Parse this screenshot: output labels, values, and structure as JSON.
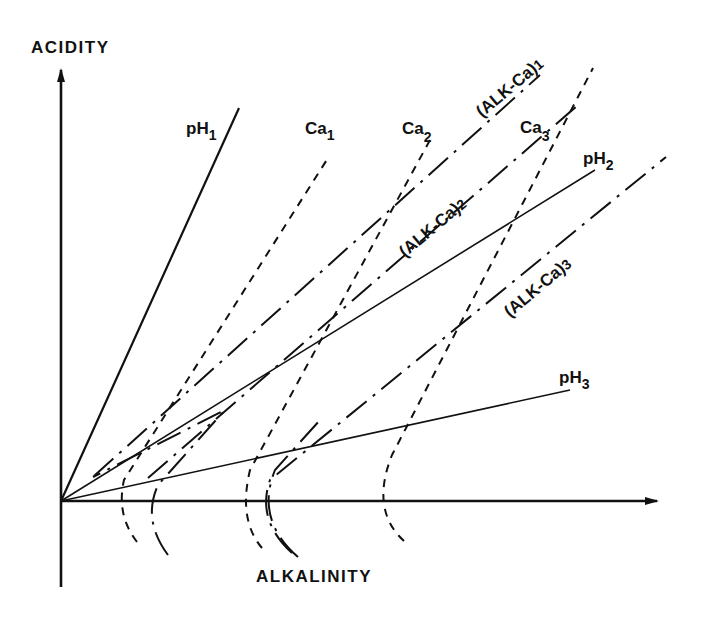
{
  "diagram": {
    "axes": {
      "y_label": "ACIDITY",
      "x_label": "ALKALINITY"
    },
    "lines": {
      "ph1": {
        "base": "pH",
        "sub": "1",
        "style": "solid"
      },
      "ph2": {
        "base": "pH",
        "sub": "2",
        "style": "solid"
      },
      "ph3": {
        "base": "pH",
        "sub": "3",
        "style": "solid"
      },
      "ca1": {
        "base": "Ca",
        "sub": "1",
        "style": "dashed"
      },
      "ca2": {
        "base": "Ca",
        "sub": "2",
        "style": "dashed"
      },
      "ca3": {
        "base": "Ca",
        "sub": "3",
        "style": "dashed"
      },
      "alkca1": {
        "base": "(ALK-Ca)",
        "sub": "1",
        "style": "dash-dot"
      },
      "alkca2": {
        "base": "(ALK-Ca)",
        "sub": "2",
        "style": "dash-dot"
      },
      "alkca3": {
        "base": "(ALK-Ca)",
        "sub": "3",
        "style": "dash-dot"
      }
    },
    "colors": {
      "ink": "#111111",
      "background": "#ffffff"
    }
  }
}
